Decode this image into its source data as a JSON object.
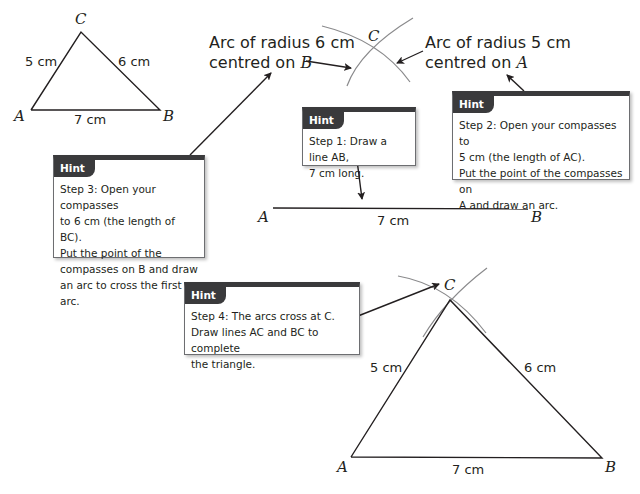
{
  "triangle_small": {
    "vertex_a": "A",
    "vertex_b": "B",
    "vertex_c": "C",
    "side_ac": "5 cm",
    "side_bc": "6 cm",
    "side_ab": "7 cm"
  },
  "arc_labels": {
    "arc_b_line1": "Arc of radius 6 cm",
    "arc_b_line2": "centred on",
    "arc_b_point": "B",
    "arc_a_line1": "Arc of radius 5 cm",
    "arc_a_line2": "centred on",
    "arc_a_point": "A",
    "intersection": "C"
  },
  "line_ab": {
    "vertex_a": "A",
    "vertex_b": "B",
    "length": "7 cm"
  },
  "hints": [
    {
      "tab": "Hint",
      "lines": [
        "Step 1: Draw a line AB,",
        "7 cm long."
      ]
    },
    {
      "tab": "Hint",
      "lines": [
        "Step 2: Open your compasses to",
        "5 cm (the length of AC).",
        "Put the point of the compasses on",
        "A and draw an arc."
      ]
    },
    {
      "tab": "Hint",
      "lines": [
        "Step 3: Open your compasses",
        "to 6 cm (the length of BC).",
        "Put the point of the",
        "compasses on B and draw",
        "an arc to cross the first arc."
      ]
    },
    {
      "tab": "Hint",
      "lines": [
        "Step 4: The arcs cross at C.",
        "Draw lines AC and BC to complete",
        "the triangle."
      ]
    }
  ],
  "triangle_large": {
    "vertex_a": "A",
    "vertex_b": "B",
    "vertex_c": "C",
    "side_ac": "5 cm",
    "side_bc": "6 cm",
    "side_ab": "7 cm"
  },
  "colors": {
    "line": "#231f20",
    "arc": "#8a8a8c",
    "hint_header": "#3a3a3c"
  }
}
